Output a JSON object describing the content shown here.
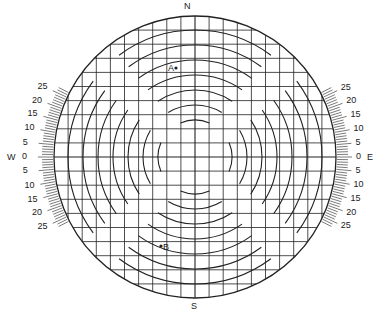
{
  "figure": {
    "type": "stereonet-style polar grid with tilt scales",
    "center": [
      195,
      157
    ],
    "radius": 141,
    "grid_divisions": 20,
    "ring_count": 8,
    "line_color": "#222222"
  },
  "compass": {
    "north": "N",
    "south": "S",
    "west": "W",
    "east": "E"
  },
  "points": [
    {
      "label": "A",
      "x": 176,
      "y": 68,
      "label_side": "left"
    },
    {
      "label": "B",
      "x": 161,
      "y": 246,
      "label_side": "right"
    }
  ],
  "scales": {
    "left": [
      "25",
      "20",
      "15",
      "10",
      "5",
      "0",
      "5",
      "10",
      "15",
      "20",
      "25"
    ],
    "right": [
      "25",
      "20",
      "15",
      "10",
      "5",
      "0",
      "5",
      "10",
      "15",
      "20",
      "25"
    ]
  }
}
